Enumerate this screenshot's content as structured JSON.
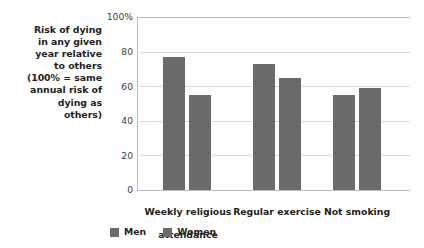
{
  "chart_data": {
    "type": "bar",
    "title": "",
    "subtitle": "",
    "xlabel": "",
    "ylabel": "Risk of dying in any given year relative to others (100% = same annual risk of dying as others)",
    "ylabel_lines": [
      "Risk of dying",
      "in any given",
      "year relative",
      "to others",
      "(100% = same",
      "annual risk of",
      "dying as",
      "others)"
    ],
    "categories": [
      "Weekly religious attendance",
      "Regular exercise",
      "Not smoking"
    ],
    "category_label_lines": [
      [
        "Weekly religious",
        "attendance"
      ],
      [
        "Regular exercise"
      ],
      [
        "Not smoking"
      ]
    ],
    "series": [
      {
        "name": "Men",
        "values": [
          77,
          73,
          55
        ],
        "color": "#6b6b6b"
      },
      {
        "name": "Women",
        "values": [
          55,
          65,
          59
        ],
        "color": "#6b6b6b"
      }
    ],
    "ylim": [
      0,
      100
    ],
    "yticks": [
      0,
      20,
      40,
      60,
      80,
      100
    ],
    "ytick_labels": [
      "0",
      "20",
      "40",
      "60",
      "80",
      "100%"
    ],
    "grid": true,
    "grid_color": "#d9d9d9",
    "legend_position": "bottom",
    "axis_color": "#bdbdbd",
    "text_color": "#231f20",
    "background": "#ffffff"
  },
  "legend": {
    "items": [
      {
        "label": "Men"
      },
      {
        "label": "Women"
      }
    ]
  }
}
